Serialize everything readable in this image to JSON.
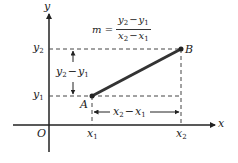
{
  "diagram": {
    "axes": {
      "x_label": "x",
      "y_label": "y",
      "origin_label": "O"
    },
    "points": [
      {
        "name": "A",
        "x_label": "x",
        "x_sub": "1",
        "y_label": "y",
        "y_sub": "1"
      },
      {
        "name": "B",
        "x_label": "x",
        "x_sub": "2",
        "y_label": "y",
        "y_sub": "2"
      }
    ],
    "formula": {
      "lhs": "m =",
      "numerator": {
        "a": "y",
        "a_sub": "2",
        "op": "−",
        "b": "y",
        "b_sub": "1"
      },
      "denominator": {
        "a": "x",
        "a_sub": "2",
        "op": "−",
        "b": "x",
        "b_sub": "1"
      }
    },
    "rise_label": {
      "a": "y",
      "a_sub": "2",
      "op": "−",
      "b": "y",
      "b_sub": "1"
    },
    "run_label": {
      "a": "x",
      "a_sub": "2",
      "op": "−",
      "b": "x",
      "b_sub": "1"
    },
    "colors": {
      "ink": "#222222",
      "segment": "#333333",
      "background": "#ffffff"
    }
  }
}
